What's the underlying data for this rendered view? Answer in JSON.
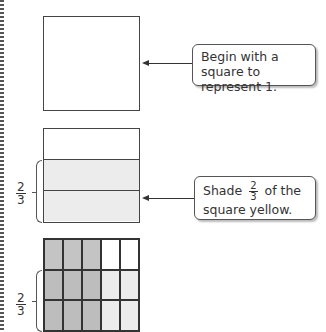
{
  "step1": {
    "callout": "Begin with a square to represent 1."
  },
  "step2": {
    "callout_before": "Shade",
    "callout_fraction": {
      "numerator": "2",
      "denominator": "3"
    },
    "callout_after": "of the square yellow.",
    "label_fraction": {
      "numerator": "2",
      "denominator": "3"
    },
    "rows": 3,
    "shaded_rows": 2
  },
  "step3": {
    "label_fraction": {
      "numerator": "2",
      "denominator": "3"
    },
    "rows": 3,
    "columns": 5,
    "shaded_columns": 3
  },
  "colors": {
    "yellow_shade": "#ececec",
    "blue_shade": "#c4c4c4",
    "overlap_shade": "#bdbdbd",
    "border": "#444444"
  }
}
